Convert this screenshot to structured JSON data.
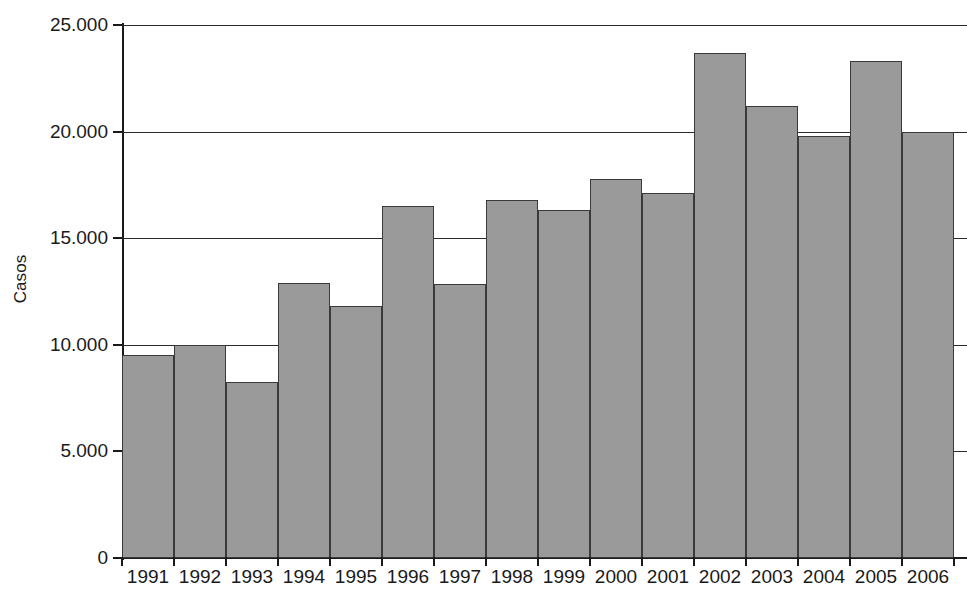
{
  "chart_data": {
    "type": "bar",
    "title": "",
    "xlabel": "",
    "ylabel": "Casos",
    "categories": [
      "1991",
      "1992",
      "1993",
      "1994",
      "1995",
      "1996",
      "1997",
      "1998",
      "1999",
      "2000",
      "2001",
      "2002",
      "2003",
      "2004",
      "2005",
      "2006"
    ],
    "values": [
      9500,
      10000,
      8250,
      12900,
      11800,
      16500,
      12850,
      16800,
      16300,
      17800,
      17100,
      23700,
      21200,
      19800,
      23300,
      20000
    ],
    "ylim": [
      0,
      25000
    ],
    "y_ticks": [
      0,
      5000,
      10000,
      15000,
      20000,
      25000
    ],
    "y_tick_labels": [
      "0",
      "5.000",
      "10.000",
      "15.000",
      "20.000",
      "25.000"
    ],
    "grid": true,
    "grid_axis": "y",
    "legend": null,
    "series_color": "#9a9a9a",
    "bar_edge_color": "#3a3a3a",
    "axis_color": "#1a1a1a"
  }
}
